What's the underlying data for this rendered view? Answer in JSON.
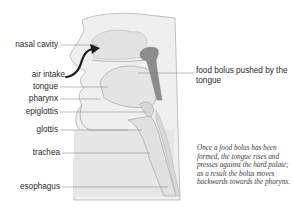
{
  "diagram": {
    "labels_left": [
      {
        "id": "nasal-cavity",
        "text": "nasal cavity",
        "y": 45
      },
      {
        "id": "air-intake",
        "text": "air intake",
        "y": 75
      },
      {
        "id": "tongue",
        "text": "tongue",
        "y": 87
      },
      {
        "id": "pharynx",
        "text": "pharynx",
        "y": 99
      },
      {
        "id": "epiglottis",
        "text": "epiglottis",
        "y": 112
      },
      {
        "id": "glottis",
        "text": "glottis",
        "y": 130
      },
      {
        "id": "trachea",
        "text": "trachea",
        "y": 153
      },
      {
        "id": "esophagus",
        "text": "esophagus",
        "y": 187
      }
    ],
    "label_right": {
      "id": "food-bolus",
      "text": "food bolus pushed by the tongue"
    },
    "caption": "Once a food bolus has been formed, the tongue rises and presses against the hard palate; as a result the bolus moves backwards towards the pharynx.",
    "colors": {
      "tissue": "#e9e9e9",
      "tissue_dark": "#d4d4d4",
      "outline": "#8a8a8a",
      "bolus": "#8c8c8c",
      "arrow": "#1e1e1e",
      "leader": "#7a7a7a",
      "text": "#2a2a2a"
    }
  }
}
